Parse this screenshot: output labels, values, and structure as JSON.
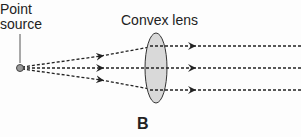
{
  "diagram": {
    "labels": {
      "point_source_line1": "Point",
      "point_source_line2": "source",
      "lens": "Convex lens",
      "figure_label": "B"
    },
    "colors": {
      "ray": "#222222",
      "lens_fill": "#d9d9d9",
      "lens_stroke": "#333333",
      "source_fill": "#999999"
    },
    "elements": {
      "point_source": {
        "x": 20,
        "y": 68
      },
      "lens": {
        "cx": 156,
        "cy": 68,
        "rx": 11,
        "ry": 35
      },
      "rays_exit_y": [
        46,
        68,
        90
      ]
    }
  }
}
